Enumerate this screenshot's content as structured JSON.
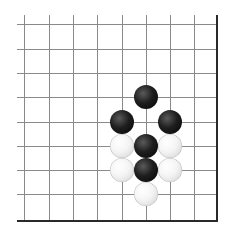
{
  "board": {
    "grid_spacing": 24.3,
    "columns": [
      1,
      2,
      3,
      4,
      5,
      6,
      7,
      8
    ],
    "rows": [
      1,
      2,
      3,
      4,
      5,
      6,
      7,
      8
    ],
    "grid_left": 17,
    "grid_top": 15,
    "right_edge_x": 216,
    "bottom_edge_y": 220,
    "line_color": "#8a8a8a",
    "edge_color": "#2a2a2a",
    "background": "#ffffff"
  },
  "stones": [
    {
      "color": "black",
      "col": 6,
      "row": 4
    },
    {
      "color": "black",
      "col": 5,
      "row": 5
    },
    {
      "color": "black",
      "col": 7,
      "row": 5
    },
    {
      "color": "white",
      "col": 5,
      "row": 6
    },
    {
      "color": "black",
      "col": 6,
      "row": 6
    },
    {
      "color": "white",
      "col": 7,
      "row": 6
    },
    {
      "color": "white",
      "col": 5,
      "row": 7
    },
    {
      "color": "black",
      "col": 6,
      "row": 7
    },
    {
      "color": "white",
      "col": 7,
      "row": 7
    },
    {
      "color": "white",
      "col": 6,
      "row": 8
    }
  ]
}
